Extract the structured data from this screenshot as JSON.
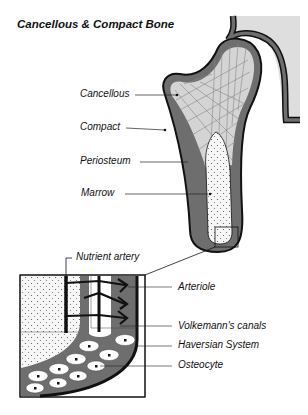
{
  "title": "Cancellous & Compact Bone",
  "labels": {
    "cancellous": "Cancellous",
    "compact": "Compact",
    "periosteum": "Periosteum",
    "marrow": "Marrow",
    "nutrient_artery": "Nutrient artery",
    "arteriole": "Arteriole",
    "volkemanns_canals": "Volkemann's canals",
    "haversian_system": "Haversian System",
    "osteocyte": "Osteocyte"
  },
  "colors": {
    "compact_bone": "#6e6e6e",
    "cancellous_bone": "#d4d4d4",
    "hip_socket": "#dedede",
    "marrow": "#f4f4f4",
    "outline": "#111111"
  }
}
